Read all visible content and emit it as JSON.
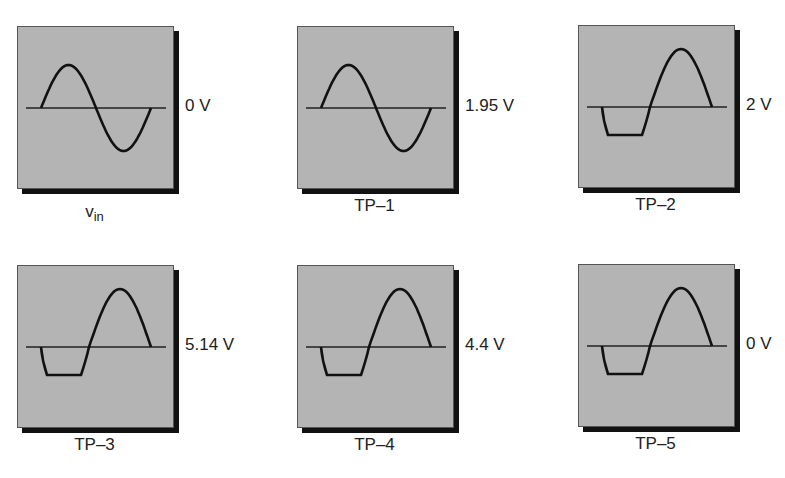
{
  "panels": [
    {
      "id": "vin",
      "name": "v",
      "subscript": "in",
      "voltage": "0 V",
      "waveform": "full-sine",
      "x": 17,
      "y": 26
    },
    {
      "id": "tp1",
      "name": "TP–1",
      "subscript": "",
      "voltage": "1.95 V",
      "waveform": "full-sine",
      "x": 297,
      "y": 26
    },
    {
      "id": "tp2",
      "name": "TP–2",
      "subscript": "",
      "voltage": "2 V",
      "waveform": "clipped-negative",
      "x": 578,
      "y": 25
    },
    {
      "id": "tp3",
      "name": "TP–3",
      "subscript": "",
      "voltage": "5.14  V",
      "waveform": "clipped-negative",
      "x": 17,
      "y": 265
    },
    {
      "id": "tp4",
      "name": "TP–4",
      "subscript": "",
      "voltage": "4.4 V",
      "waveform": "clipped-negative",
      "x": 297,
      "y": 265
    },
    {
      "id": "tp5",
      "name": "TP–5",
      "subscript": "",
      "voltage": "0 V",
      "waveform": "clipped-negative",
      "x": 578,
      "y": 264
    }
  ],
  "colors": {
    "screen": "#b4b4b4",
    "shadow": "#111111",
    "trace": "#111111"
  }
}
